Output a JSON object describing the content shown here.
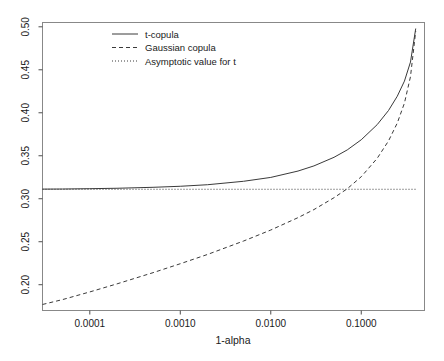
{
  "chart_data": {
    "type": "line",
    "title": "",
    "xlabel": "1-alpha",
    "ylabel": "",
    "xscale": "log",
    "yscale": "linear",
    "xlim": [
      3e-05,
      0.5
    ],
    "ylim": [
      0.17,
      0.505
    ],
    "grid": false,
    "legend_position": "top-left-inside",
    "xticks": [
      0.0001,
      0.001,
      0.01,
      0.1
    ],
    "xtick_labels": [
      "0.0001",
      "0.0010",
      "0.0100",
      "0.1000"
    ],
    "yticks": [
      0.2,
      0.25,
      0.3,
      0.35,
      0.4,
      0.45,
      0.5
    ],
    "ytick_labels": [
      "0.20",
      "0.25",
      "0.30",
      "0.35",
      "0.40",
      "0.45",
      "0.50"
    ],
    "series": [
      {
        "name": "t-copula",
        "style": "solid",
        "color": "#3a3a3a",
        "x": [
          3e-05,
          5e-05,
          0.0001,
          0.0002,
          0.0005,
          0.001,
          0.002,
          0.005,
          0.01,
          0.02,
          0.03,
          0.05,
          0.07,
          0.1,
          0.15,
          0.2,
          0.25,
          0.3,
          0.35,
          0.4
        ],
        "y": [
          0.3112,
          0.3113,
          0.3117,
          0.3122,
          0.3133,
          0.3145,
          0.3163,
          0.3203,
          0.3248,
          0.3322,
          0.3382,
          0.3482,
          0.3568,
          0.3686,
          0.3862,
          0.4026,
          0.4192,
          0.4368,
          0.459,
          0.498
        ]
      },
      {
        "name": "Gaussian copula",
        "style": "dashed",
        "color": "#3a3a3a",
        "x": [
          3e-05,
          5e-05,
          0.0001,
          0.0002,
          0.0005,
          0.001,
          0.002,
          0.005,
          0.01,
          0.02,
          0.03,
          0.05,
          0.07,
          0.1,
          0.15,
          0.2,
          0.25,
          0.3,
          0.35,
          0.4
        ],
        "y": [
          0.177,
          0.1827,
          0.1916,
          0.201,
          0.214,
          0.2244,
          0.2352,
          0.2508,
          0.2636,
          0.278,
          0.2874,
          0.3012,
          0.3116,
          0.3256,
          0.347,
          0.3672,
          0.388,
          0.4112,
          0.442,
          0.495
        ]
      },
      {
        "name": "Asymptotic value for t",
        "style": "dotted",
        "color": "#555555",
        "x": [
          3e-05,
          0.4
        ],
        "y": [
          0.311,
          0.311
        ]
      }
    ],
    "asymptote_value": 0.311
  },
  "legend": {
    "entries": [
      {
        "label": "t-copula",
        "style": "solid"
      },
      {
        "label": "Gaussian copula",
        "style": "dashed"
      },
      {
        "label": "Asymptotic value for t",
        "style": "dotted"
      }
    ]
  },
  "axes": {
    "x_title": "1-alpha",
    "y_title": ""
  }
}
